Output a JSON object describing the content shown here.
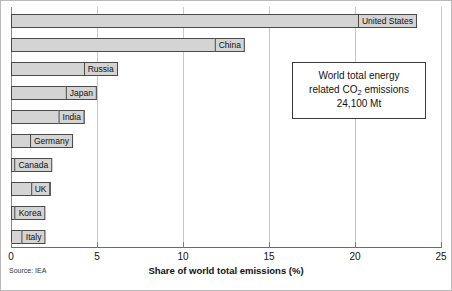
{
  "chart_data": {
    "type": "bar",
    "orientation": "horizontal",
    "title": "",
    "xlabel": "Share of world total emissions (%)",
    "ylabel": "",
    "xlim": [
      0,
      25
    ],
    "xticks": [
      0,
      5,
      10,
      15,
      20,
      25
    ],
    "xtick_labels": [
      "0",
      "5",
      "10",
      "15",
      "20",
      "25"
    ],
    "grid": true,
    "grid_axis": "x",
    "legend": false,
    "categories": [
      "United States",
      "China",
      "Russia",
      "Japan",
      "India",
      "Germany",
      "Canada",
      "UK",
      "Korea",
      "Italy"
    ],
    "values": [
      23.6,
      13.6,
      6.2,
      5.0,
      4.3,
      3.6,
      2.4,
      2.3,
      2.0,
      2.0
    ],
    "bar_fill_color": "#d4d4d4",
    "bar_edge_color": "#4a4a4a",
    "annotations": [
      {
        "name": "world-total-box",
        "lines": [
          "World total energy",
          "related CO2 emissions",
          "24,100 Mt"
        ]
      }
    ]
  },
  "annotation_box": {
    "line1": "World total energy",
    "line2_pre": "related CO",
    "line2_sub": "2",
    "line2_post": " emissions",
    "line3": "24,100 Mt"
  },
  "source": {
    "text": "Source: IEA"
  },
  "axis": {
    "x_title": "Share of world total emissions (%)"
  }
}
